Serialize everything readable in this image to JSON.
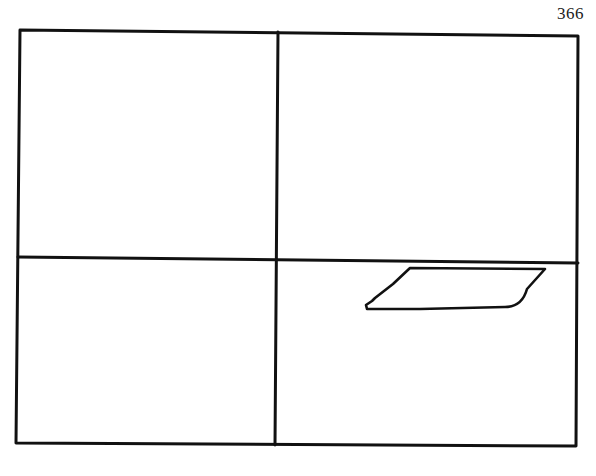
{
  "page": {
    "number": "366"
  },
  "figure": {
    "grid": {
      "rows": 2,
      "cols": 2
    },
    "quadrants": [
      {
        "position": "top-left",
        "content": ""
      },
      {
        "position": "top-right",
        "content": ""
      },
      {
        "position": "bottom-left",
        "content": ""
      },
      {
        "position": "bottom-right",
        "content": "parallelogram"
      }
    ],
    "shape": {
      "type": "parallelogram",
      "quadrant": "bottom-right",
      "stroke_color": "#111111"
    },
    "line_color": "#111111",
    "background": "#ffffff"
  }
}
